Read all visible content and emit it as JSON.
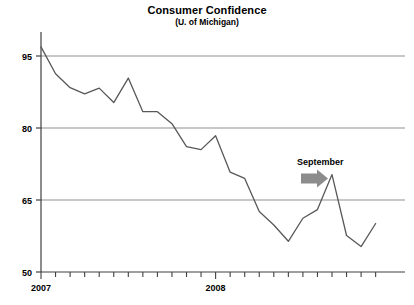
{
  "chart_data": {
    "type": "line",
    "title": "Consumer Confidence",
    "subtitle": "(U. of Michigan)",
    "xlabel": "",
    "ylabel": "",
    "ylim": [
      50,
      100
    ],
    "yticks": [
      50,
      65,
      80,
      95
    ],
    "ytick_labels": [
      "50",
      "65",
      "80",
      "95"
    ],
    "grid": "horizontal",
    "legend": "none",
    "xtick_labels": [
      "2007",
      "2008"
    ],
    "x": [
      "2007-01",
      "2007-02",
      "2007-03",
      "2007-04",
      "2007-05",
      "2007-06",
      "2007-07",
      "2007-08",
      "2007-09",
      "2007-10",
      "2007-11",
      "2007-12",
      "2008-01",
      "2008-02",
      "2008-03",
      "2008-04",
      "2008-05",
      "2008-06",
      "2008-07",
      "2008-08",
      "2008-09",
      "2008-10",
      "2008-11",
      "2008-12"
    ],
    "values": [
      96.9,
      91.3,
      88.4,
      87.1,
      88.3,
      85.3,
      90.4,
      83.4,
      83.4,
      80.9,
      76.1,
      75.5,
      78.4,
      70.8,
      69.5,
      62.6,
      59.8,
      56.4,
      61.2,
      63.0,
      70.3,
      57.6,
      55.3,
      60.1
    ],
    "annotations": [
      {
        "text": "September",
        "icon": "right-arrow",
        "arrow_color": "#8c8c8c",
        "points_to_value": 70.3
      }
    ],
    "line_color": "#585858",
    "grid_color": "#909090",
    "axis_color": "#404040"
  }
}
